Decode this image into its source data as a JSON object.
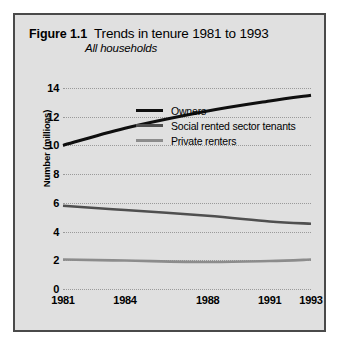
{
  "figure": {
    "number": "Figure 1.1",
    "title": "Trends in tenure 1981 to 1993",
    "subtitle": "All households"
  },
  "colors": {
    "panel_background": "#e0e0e0",
    "frame_border": "#4a4a4a",
    "gridline": "#9a9a9a",
    "owners": "#0f0f0f",
    "social_rented": "#4f4f4f",
    "private_renters": "#8c8c8c"
  },
  "chart_data": {
    "type": "line",
    "title": "Trends in tenure 1981 to 1993",
    "subtitle": "All households",
    "xlabel": "",
    "ylabel": "Number (millions)",
    "xlim": [
      1981,
      1993
    ],
    "ylim": [
      0,
      14
    ],
    "grid": true,
    "legend_position": "center",
    "xticks": [
      1981,
      1984,
      1988,
      1991,
      1993
    ],
    "xtick_labels": [
      "1981",
      "1984",
      "1988",
      "1991",
      "1993"
    ],
    "yticks": [
      0,
      2,
      4,
      6,
      8,
      10,
      12,
      14
    ],
    "ytick_labels": [
      "0",
      "2",
      "4",
      "6",
      "8",
      "10",
      "12",
      "14"
    ],
    "x": [
      1981,
      1984,
      1988,
      1991,
      1993
    ],
    "series": [
      {
        "name": "Owners",
        "color": "#0f0f0f",
        "width": 3.1,
        "values": [
          10.0,
          11.2,
          12.4,
          13.1,
          13.5
        ]
      },
      {
        "name": "Social rented sector tenants",
        "color": "#4f4f4f",
        "width": 2.6,
        "values": [
          5.8,
          5.5,
          5.1,
          4.7,
          4.55
        ]
      },
      {
        "name": "Private renters",
        "color": "#8c8c8c",
        "width": 2.6,
        "values": [
          2.05,
          1.98,
          1.88,
          1.95,
          2.05
        ]
      }
    ]
  }
}
